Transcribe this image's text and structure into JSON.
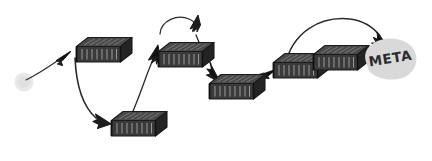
{
  "diagram": {
    "type": "flow-sketch",
    "title": "",
    "style": "hand-drawn",
    "canvas": {
      "width": 432,
      "height": 161,
      "background": "#ffffff"
    },
    "colors": {
      "stroke": "#262626",
      "node_fill": "#3a3a3a",
      "node_dark": "#1f1f1f",
      "node_light": "#6e6e6e",
      "blob_fill": "#d9d9d9",
      "start_fill": "#e8e8e8",
      "text": "#2b2b2b"
    },
    "start": {
      "name": "start-dot",
      "shape": "circle",
      "label": "",
      "cx": 24,
      "cy": 82,
      "r": 9
    },
    "end": {
      "name": "meta-blob",
      "shape": "blob",
      "label": "META",
      "cx": 391,
      "cy": 61
    },
    "nodes": [
      {
        "id": "n1",
        "label": "",
        "kind": "container-box",
        "x": 88,
        "y": 54
      },
      {
        "id": "n2",
        "label": "",
        "kind": "container-box",
        "x": 122,
        "y": 122
      },
      {
        "id": "n3",
        "label": "",
        "kind": "container-box",
        "x": 175,
        "y": 58
      },
      {
        "id": "n4",
        "label": "",
        "kind": "container-box",
        "x": 228,
        "y": 96
      },
      {
        "id": "n5",
        "label": "",
        "kind": "container-box",
        "x": 291,
        "y": 68
      },
      {
        "id": "n6",
        "label": "",
        "kind": "container-box",
        "x": 330,
        "y": 60
      }
    ],
    "edges": [
      {
        "id": "e1",
        "from": "start-dot",
        "to": "n1",
        "kind": "straight-arrow",
        "label": ""
      },
      {
        "id": "e2",
        "from": "n1",
        "to": "n2",
        "kind": "curved-arrow",
        "label": ""
      },
      {
        "id": "e3",
        "from": "n2",
        "to": "n3",
        "kind": "curved-arrow",
        "label": ""
      },
      {
        "id": "e4",
        "from": "n3",
        "to": "n3",
        "kind": "loop-arrow",
        "label": ""
      },
      {
        "id": "e5",
        "from": "n3",
        "to": "n4",
        "kind": "curved-arrow",
        "label": ""
      },
      {
        "id": "e6",
        "from": "n4",
        "to": "n5",
        "kind": "straight-arrow",
        "label": ""
      },
      {
        "id": "e7",
        "from": "n5",
        "to": "meta-blob",
        "kind": "arc-arrow",
        "label": ""
      }
    ]
  }
}
